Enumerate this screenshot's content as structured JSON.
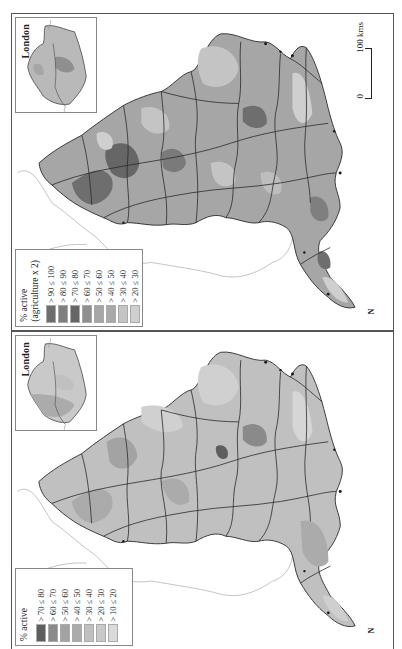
{
  "figure": {
    "layout": "two stacked choropleth map panels, rotated 90 degrees",
    "colors": {
      "border": "#555555",
      "coast": "#999999",
      "boundary": "#2a2a2a",
      "background": "#ffffff"
    }
  },
  "panels": [
    {
      "id": "top",
      "inset": {
        "title": "London"
      },
      "legend": {
        "title_line1": "% active",
        "title_line2": "(agriculture x 2)",
        "items": [
          {
            "label": "> 90 ≤ 100",
            "color": "#6e6e6e"
          },
          {
            "label": "> 80 ≤ 90",
            "color": "#7f7f7f"
          },
          {
            "label": "> 70 ≤ 80",
            "color": "#666666"
          },
          {
            "label": "> 60 ≤ 70",
            "color": "#8f8f8f"
          },
          {
            "label": "> 50 ≤ 60",
            "color": "#a6a6a6"
          },
          {
            "label": "> 40 ≤ 50",
            "color": "#a9a9a9"
          },
          {
            "label": "> 30 ≤ 40",
            "color": "#c4c4c4"
          },
          {
            "label": "> 20 ≤ 30",
            "color": "#cfcfcf"
          }
        ]
      },
      "scale_bar": {
        "start_label": "0",
        "end_label": "100 kms"
      },
      "north_mark": "N"
    },
    {
      "id": "bottom",
      "inset": {
        "title": "London"
      },
      "legend": {
        "title_line1": "% active",
        "title_line2": "",
        "items": [
          {
            "label": "> 70 ≤ 80",
            "color": "#5e5e5e"
          },
          {
            "label": "> 60 ≤ 70",
            "color": "#8a8a8a"
          },
          {
            "label": "> 50 ≤ 60",
            "color": "#a3a3a3"
          },
          {
            "label": "> 40 ≤ 50",
            "color": "#ababab"
          },
          {
            "label": "> 30 ≤ 40",
            "color": "#c0c0c0"
          },
          {
            "label": "> 20 ≤ 30",
            "color": "#c9c9c9"
          },
          {
            "label": "> 10 ≤ 20",
            "color": "#dadada"
          }
        ]
      },
      "north_mark": "N"
    }
  ]
}
